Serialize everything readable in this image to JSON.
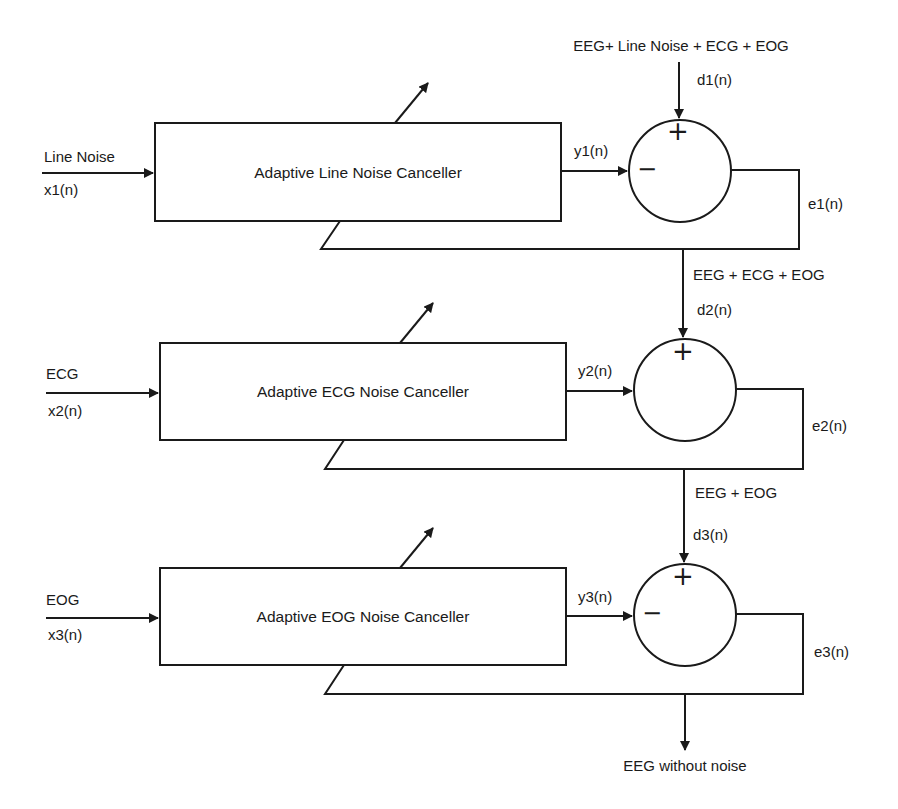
{
  "diagram": {
    "type": "block-diagram",
    "stroke_color": "#1a1a1a",
    "background": "#ffffff",
    "stages": [
      {
        "block_label": "Adaptive Line Noise Canceller",
        "reference_input": {
          "name": "Line Noise",
          "signal": "x1(n)"
        },
        "filter_output": "y1(n)",
        "primary_input": {
          "name": "EEG+ Line Noise + ECG + EOG",
          "signal": "d1(n)"
        },
        "summer_signs": {
          "top": "+",
          "left": "−"
        },
        "error_output": "e1(n)"
      },
      {
        "block_label": "Adaptive ECG Noise Canceller",
        "reference_input": {
          "name": "ECG",
          "signal": "x2(n)"
        },
        "filter_output": "y2(n)",
        "primary_input": {
          "name": "EEG + ECG + EOG",
          "signal": "d2(n)"
        },
        "summer_signs": {
          "top": "+",
          "left": ""
        },
        "error_output": "e2(n)"
      },
      {
        "block_label": "Adaptive EOG Noise Canceller",
        "reference_input": {
          "name": "EOG",
          "signal": "x3(n)"
        },
        "filter_output": "y3(n)",
        "primary_input": {
          "name": "EEG + EOG",
          "signal": "d3(n)"
        },
        "summer_signs": {
          "top": "+",
          "left": "−"
        },
        "error_output": "e3(n)"
      }
    ],
    "final_output": "EEG without noise"
  }
}
